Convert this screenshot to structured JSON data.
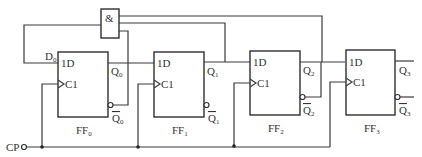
{
  "diagram": {
    "type": "circuit",
    "title": "",
    "and_gate": {
      "label": "&"
    },
    "clock_input": {
      "label": "CP"
    },
    "flip_flops": [
      {
        "name": "FF",
        "sub": "0",
        "d_label": "1D",
        "clk_label": "C1",
        "q": "Q",
        "qbar": "Q",
        "input_label": "D",
        "input_sub": "0"
      },
      {
        "name": "FF",
        "sub": "1",
        "d_label": "1D",
        "clk_label": "C1",
        "q": "Q",
        "qbar": "Q"
      },
      {
        "name": "FF",
        "sub": "2",
        "d_label": "1D",
        "clk_label": "C1",
        "q": "Q",
        "qbar": "Q"
      },
      {
        "name": "FF",
        "sub": "3",
        "d_label": "1D",
        "clk_label": "C1",
        "q": "Q",
        "qbar": "Q"
      }
    ],
    "connections": [
      "AND output -> D0 (feedback)",
      "Q2 -> AND input",
      "Q1 -> AND input",
      "Q0-bar -> AND input",
      "Q0 -> 1D of FF1",
      "Q1 -> 1D of FF2",
      "Q2 -> 1D of FF3",
      "CP -> C1 of FF0, FF1, FF2, FF3"
    ]
  }
}
